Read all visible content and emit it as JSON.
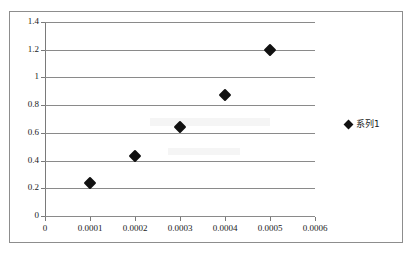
{
  "chart_data": {
    "type": "scatter",
    "title": "",
    "xlabel": "",
    "ylabel": "",
    "xlim": [
      0,
      0.0006
    ],
    "ylim": [
      0,
      1.4
    ],
    "grid": "horizontal",
    "legend_position": "right",
    "x_ticks": [
      "0",
      "0.0001",
      "0.0002",
      "0.0003",
      "0.0004",
      "0.0005",
      "0.0006"
    ],
    "x_tick_values": [
      0,
      0.0001,
      0.0002,
      0.0003,
      0.0004,
      0.0005,
      0.0006
    ],
    "y_ticks": [
      "0",
      "0.2",
      "0.4",
      "0.6",
      "0.8",
      "1",
      "1.2",
      "1.4"
    ],
    "y_tick_values": [
      0,
      0.2,
      0.4,
      0.6,
      0.8,
      1,
      1.2,
      1.4
    ],
    "series": [
      {
        "name": "系列1",
        "marker": "diamond",
        "color": "#111111",
        "x": [
          0.0001,
          0.0002,
          0.0003,
          0.0004,
          0.0005
        ],
        "y": [
          0.24,
          0.43,
          0.64,
          0.87,
          1.2
        ]
      }
    ]
  },
  "legend": {
    "entries": [
      {
        "label": "系列1",
        "marker": "diamond-icon"
      }
    ]
  },
  "colors": {
    "marker": "#111111",
    "gridline": "#8a8a8a",
    "axis": "#7a7a7a",
    "frame": "#8d8d8d",
    "background": "#ffffff"
  }
}
